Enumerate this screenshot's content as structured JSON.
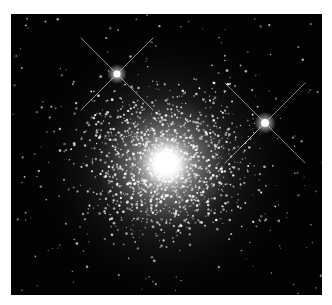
{
  "caption": {
    "text": ""
  },
  "image": {
    "subject": "globular star cluster",
    "description": "Dense globular cluster with a bright core and two foreground stars showing diffraction spikes",
    "background_color": "#020202",
    "core": {
      "x": 155,
      "y": 149,
      "color": "#ffffff"
    },
    "foreground_stars": [
      {
        "x": 106,
        "y": 60
      },
      {
        "x": 254,
        "y": 109
      }
    ]
  }
}
